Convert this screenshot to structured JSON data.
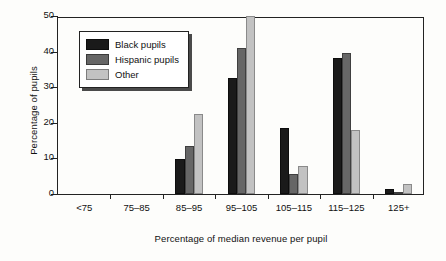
{
  "chart_data": {
    "type": "bar",
    "title": "",
    "subtitle": "",
    "xlabel": "Percentage of median revenue per pupil",
    "ylabel": "Percentage of pupils",
    "categories": [
      "<75",
      "75–85",
      "85–95",
      "95–105",
      "105–115",
      "115–125",
      "125+"
    ],
    "series": [
      {
        "name": "Black pupils",
        "color": "#1a1a1a",
        "values": [
          0,
          0,
          9.8,
          32.5,
          18.5,
          38.3,
          1.5
        ]
      },
      {
        "name": "Hispanic pupils",
        "color": "#666666",
        "values": [
          0,
          0,
          13.6,
          41.0,
          5.5,
          39.6,
          0.6
        ]
      },
      {
        "name": "Other",
        "color": "#c2c2c2",
        "values": [
          0,
          0,
          22.6,
          50.0,
          8.0,
          18.0,
          2.8
        ]
      }
    ],
    "ylim": [
      0,
      50
    ],
    "yticks": [
      0,
      10,
      20,
      30,
      40,
      50
    ],
    "ytick_labels": [
      "0",
      "10",
      "20",
      "30",
      "40",
      "50"
    ],
    "grid": false,
    "legend_position": "upper-left-inside",
    "legend_entries": [
      "Black pupils",
      "Hispanic pupils",
      "Other"
    ]
  }
}
